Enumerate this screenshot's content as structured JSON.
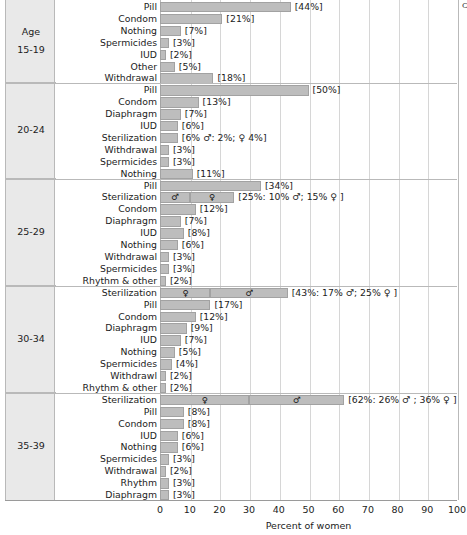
{
  "figure": {
    "side_header": "Age",
    "xaxis_title": "Percent of women",
    "xticks": [
      "0",
      "10",
      "20",
      "30",
      "40",
      "50",
      "60",
      "70",
      "80",
      "90",
      "100"
    ],
    "bar_color": "#bdbdbd",
    "bar_border_color": "#a2a2a2",
    "panel_color": "#e9e9e9",
    "grid_color": "#d6d6d6"
  },
  "chart_data": {
    "type": "bar",
    "title": "",
    "xlabel": "Percent of women",
    "ylabel": "",
    "xlim": [
      0,
      100
    ],
    "grid": true,
    "orientation": "horizontal",
    "legend": null,
    "groups": [
      {
        "age": "15-19",
        "rows": [
          {
            "label": "Pill",
            "value": 44,
            "text": "[44%]"
          },
          {
            "label": "Condom",
            "value": 21,
            "text": "[21%]"
          },
          {
            "label": "Nothing",
            "value": 7,
            "text": "[7%]"
          },
          {
            "label": "Spermicides",
            "value": 3,
            "text": "[3%]"
          },
          {
            "label": "IUD",
            "value": 2,
            "text": "[2%]"
          },
          {
            "label": "Other",
            "value": 5,
            "text": "[5%]"
          },
          {
            "label": "Withdrawal",
            "value": 18,
            "text": "[18%]"
          }
        ]
      },
      {
        "age": "20-24",
        "rows": [
          {
            "label": "Pill",
            "value": 50,
            "text": "[50%]"
          },
          {
            "label": "Condom",
            "value": 13,
            "text": "[13%]"
          },
          {
            "label": "Diaphragm",
            "value": 7,
            "text": "[7%]"
          },
          {
            "label": "IUD",
            "value": 6,
            "text": "[6%]"
          },
          {
            "label": "Sterilization",
            "value": 6,
            "text": "[6% ♂: 2%; ♀ 4%]"
          },
          {
            "label": "Withdrawal",
            "value": 3,
            "text": "[3%]"
          },
          {
            "label": "Spermicides",
            "value": 3,
            "text": "[3%]"
          },
          {
            "label": "Nothing",
            "value": 11,
            "text": "[11%]"
          }
        ]
      },
      {
        "age": "25-29",
        "rows": [
          {
            "label": "Pill",
            "value": 34,
            "text": "[34%]"
          },
          {
            "label": "Sterilization",
            "value": 25,
            "text": "[25%: 10% ♂; 15% ♀ ]",
            "segments": [
              {
                "symbol": "♂",
                "value": 10
              },
              {
                "symbol": "♀",
                "value": 15
              }
            ]
          },
          {
            "label": "Condom",
            "value": 12,
            "text": "[12%]"
          },
          {
            "label": "Diaphragm",
            "value": 7,
            "text": "[7%]"
          },
          {
            "label": "IUD",
            "value": 8,
            "text": "[8%]"
          },
          {
            "label": "Nothing",
            "value": 6,
            "text": "[6%]"
          },
          {
            "label": "Withdrawal",
            "value": 3,
            "text": "[3%]"
          },
          {
            "label": "Spermicides",
            "value": 3,
            "text": "[3%]"
          },
          {
            "label": "Rhythm & other",
            "value": 2,
            "text": "[2%]"
          }
        ]
      },
      {
        "age": "30-34",
        "rows": [
          {
            "label": "Sterilization",
            "value": 43,
            "text": "[43%: 17% ♂; 25% ♀ ]",
            "segments": [
              {
                "symbol": "♀",
                "value": 17
              },
              {
                "symbol": "♂",
                "value": 26
              }
            ]
          },
          {
            "label": "Pill",
            "value": 17,
            "text": "[17%]"
          },
          {
            "label": "Condom",
            "value": 12,
            "text": "[12%]"
          },
          {
            "label": "Diaphragm",
            "value": 9,
            "text": "[9%]"
          },
          {
            "label": "IUD",
            "value": 7,
            "text": "[7%]"
          },
          {
            "label": "Nothing",
            "value": 5,
            "text": "[5%]"
          },
          {
            "label": "Spermicides",
            "value": 4,
            "text": "[4%]"
          },
          {
            "label": "Withdrawl",
            "value": 2,
            "text": "[2%]"
          },
          {
            "label": "Rhythm & other",
            "value": 2,
            "text": "[2%]"
          }
        ]
      },
      {
        "age": "35-39",
        "rows": [
          {
            "label": "Sterilization",
            "value": 62,
            "text": "[62%: 26% ♂ ; 36% ♀ ]",
            "segments": [
              {
                "symbol": "♀",
                "value": 30
              },
              {
                "symbol": "♂",
                "value": 32
              }
            ]
          },
          {
            "label": "Pill",
            "value": 8,
            "text": "[8%]"
          },
          {
            "label": "Condom",
            "value": 8,
            "text": "[8%]"
          },
          {
            "label": "IUD",
            "value": 6,
            "text": "[6%]"
          },
          {
            "label": "Nothing",
            "value": 6,
            "text": "[6%]"
          },
          {
            "label": "Spermicides",
            "value": 3,
            "text": "[3%]"
          },
          {
            "label": "Withdrawal",
            "value": 2,
            "text": "[2%]"
          },
          {
            "label": "Rhythm",
            "value": 3,
            "text": "[3%]"
          },
          {
            "label": "Diaphragm",
            "value": 3,
            "text": "[3%]"
          }
        ]
      }
    ]
  }
}
